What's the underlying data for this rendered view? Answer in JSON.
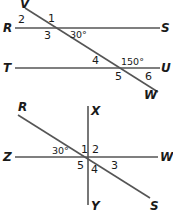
{
  "figure_top": {
    "points": {
      "V": "V",
      "R": "R",
      "S": "S",
      "T": "T",
      "U": "U",
      "W": "W"
    },
    "angles": {
      "a1": "1",
      "a2": "2",
      "a3": "3",
      "a4": "4",
      "a5": "5",
      "a6": "6"
    },
    "measures": {
      "m30": "30°",
      "m150": "150°"
    }
  },
  "figure_bottom": {
    "points": {
      "R": "R",
      "X": "X",
      "Z": "Z",
      "W": "W",
      "Y": "Y",
      "S": "S"
    },
    "angles": {
      "a1": "1",
      "a2": "2",
      "a3": "3",
      "a4": "4",
      "a5": "5"
    },
    "measures": {
      "m30": "30°"
    }
  }
}
